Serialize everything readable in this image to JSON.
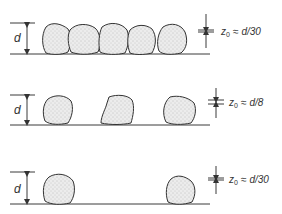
{
  "diagram": {
    "rows": [
      {
        "id": "dense",
        "height_label": "d",
        "z0_symbol": "z",
        "z0_subscript": "0",
        "z0_relation": "≈",
        "z0_value": "d/30",
        "particle_count": 5
      },
      {
        "id": "medium",
        "height_label": "d",
        "z0_symbol": "z",
        "z0_subscript": "0",
        "z0_relation": "≈",
        "z0_value": "d/8",
        "particle_count": 3
      },
      {
        "id": "sparse",
        "height_label": "d",
        "z0_symbol": "z",
        "z0_subscript": "0",
        "z0_relation": "≈",
        "z0_value": "d/30",
        "particle_count": 2
      }
    ],
    "colors": {
      "line": "#3a3a3a",
      "particle_fill": "#e6e6e6",
      "background": "#ffffff"
    }
  }
}
